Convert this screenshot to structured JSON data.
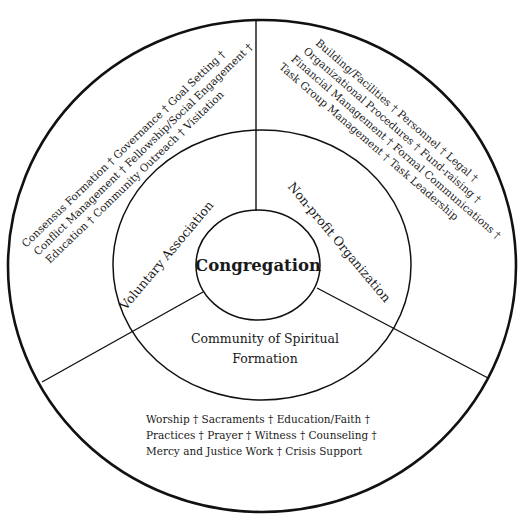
{
  "diagram": {
    "center": {
      "label": "Congregation"
    },
    "inner_ring": {
      "voluntary": "Voluntary Association",
      "nonprofit": "Non-profit Organization",
      "spiritual_line1": "Community of Spiritual",
      "spiritual_line2": "Formation"
    },
    "outer_ring": {
      "voluntary_lines": [
        "Consensus Formation † Governance † Goal Setting †",
        "Conflict Management † Fellowship/Social Engagement †",
        "Education † Community Outreach † Visitation"
      ],
      "nonprofit_lines": [
        "Building/Facilities † Personnel † Legal †",
        "Organizational Procedures † Fund-raising †",
        "Financial Management † Formal Communications †",
        "Task Group Management † Task Leadership"
      ],
      "spiritual_lines": [
        "Worship † Sacraments † Education/Faith †",
        "Practices † Prayer † Witness † Counseling †",
        "Mercy and Justice Work † Crisis Support"
      ]
    },
    "colors": {
      "stroke": "#111111",
      "text": "#1a1a1a",
      "background": "#ffffff"
    }
  }
}
